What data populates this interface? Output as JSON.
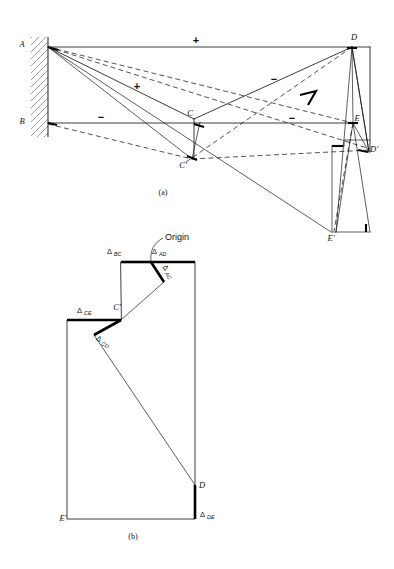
{
  "figure": {
    "title_parts": [
      "(a)",
      "(b)"
    ],
    "caption_a": "(a)",
    "caption_b": "(b)"
  },
  "panel_a": {
    "name": "truss-with-displacement-construction",
    "caption": "(a)",
    "joint_labels": [
      {
        "id": "A",
        "text": "A",
        "x": 22,
        "y": 47
      },
      {
        "id": "B",
        "text": "B",
        "x": 22,
        "y": 124
      },
      {
        "id": "C",
        "text": "C",
        "x": 190,
        "y": 116
      },
      {
        "id": "Cp",
        "text": "C'",
        "x": 183,
        "y": 168
      },
      {
        "id": "D",
        "text": "D",
        "x": 354,
        "y": 40
      },
      {
        "id": "E",
        "text": "E",
        "x": 356,
        "y": 121
      },
      {
        "id": "Dp",
        "text": "D'",
        "x": 371,
        "y": 152
      },
      {
        "id": "Ep",
        "text": "E'",
        "x": 331,
        "y": 240
      }
    ],
    "member_signs": [
      {
        "sign": "+",
        "member": "AD",
        "x": 196,
        "y": 44
      },
      {
        "sign": "+",
        "member": "AC",
        "x": 137,
        "y": 88
      },
      {
        "sign": "−",
        "member": "DC",
        "x": 274,
        "y": 81
      },
      {
        "sign": "−",
        "member": "BC",
        "x": 101,
        "y": 119
      },
      {
        "sign": "−",
        "member": "CE",
        "x": 292,
        "y": 120
      }
    ],
    "support": {
      "label": "fixed-wall-hatching"
    }
  },
  "panel_b": {
    "name": "williot-mohr-displacement-diagram",
    "caption": "(b)",
    "origin_label": "Origin",
    "point_labels": [
      {
        "id": "Cp",
        "text": "C'",
        "x": 117,
        "y": 310
      },
      {
        "id": "D",
        "text": "D",
        "x": 198,
        "y": 487
      },
      {
        "id": "Ep",
        "text": "E'",
        "x": 65,
        "y": 521
      }
    ],
    "delta_labels": [
      {
        "id": "BC",
        "glyph": "Δ",
        "sub": "BC",
        "x": 113,
        "y": 252
      },
      {
        "id": "AD",
        "glyph": "Δ",
        "sub": "AD",
        "x": 157,
        "y": 252
      },
      {
        "id": "AC",
        "glyph": "Δ",
        "sub": "AC",
        "x": 168,
        "y": 270,
        "rotate": 55
      },
      {
        "id": "CE",
        "glyph": "Δ",
        "sub": "CE",
        "x": 83,
        "y": 312
      },
      {
        "id": "CD",
        "glyph": "Δ",
        "sub": "CD",
        "x": 101,
        "y": 341,
        "rotate": 28
      },
      {
        "id": "DE",
        "glyph": "Δ",
        "sub": "DE",
        "x": 200,
        "y": 517
      }
    ]
  },
  "colors": {
    "ink": "#1a1a1a",
    "heavy": "#000000",
    "hatch": "#555555",
    "background": "#ffffff"
  }
}
